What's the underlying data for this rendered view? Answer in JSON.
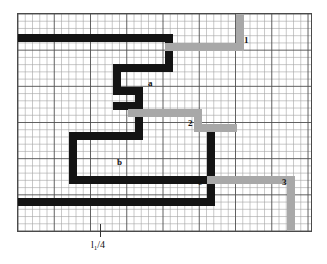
{
  "figure": {
    "title": "",
    "type": "grid-path-diagram",
    "colors": {
      "black_path": "#141414",
      "gray_path": "#a8a8a8",
      "grid_line": "#9a9a9a",
      "grid_major": "#555555",
      "border": "#4a4a4a",
      "background": "#ffffff"
    },
    "grid": {
      "x": 17,
      "y": 13,
      "width": 295,
      "height": 219,
      "cell": 7.3,
      "cols": 40,
      "rows": 30,
      "major_every": 5
    },
    "axis": {
      "bottom_label": "l",
      "bottom_label_sub": "1",
      "bottom_label_rest": "/4",
      "bottom_label_full": "l1/4",
      "tick_x": 100
    },
    "labels": [
      {
        "text": "1",
        "x": 244,
        "y": 36
      },
      {
        "text": "a",
        "x": 148,
        "y": 79
      },
      {
        "text": "2",
        "x": 188,
        "y": 119
      },
      {
        "text": "b",
        "x": 117,
        "y": 158
      },
      {
        "text": "c",
        "x": 198,
        "y": 178
      },
      {
        "text": "3",
        "x": 282,
        "y": 178
      }
    ],
    "segments": [
      {
        "name": "black-top-horizontal-bar",
        "color": "black",
        "x": 0,
        "y": 20,
        "w": 155,
        "h": 8
      },
      {
        "name": "black-stub-down-from-top-bar",
        "color": "black",
        "x": 147,
        "y": 20,
        "w": 8,
        "h": 30
      },
      {
        "name": "black-zig-a-horizontal",
        "color": "black",
        "x": 95,
        "y": 50,
        "w": 60,
        "h": 8
      },
      {
        "name": "black-zig-a-left-vertical",
        "color": "black",
        "x": 95,
        "y": 50,
        "w": 8,
        "h": 30
      },
      {
        "name": "black-zig-mid-horizontal",
        "color": "black",
        "x": 95,
        "y": 73,
        "w": 30,
        "h": 8
      },
      {
        "name": "black-zig-mid-vertical",
        "color": "black",
        "x": 117,
        "y": 73,
        "w": 8,
        "h": 22
      },
      {
        "name": "black-lower-connector-horizontal",
        "color": "black",
        "x": 95,
        "y": 88,
        "w": 30,
        "h": 8
      },
      {
        "name": "black-down-to-b-vertical",
        "color": "black",
        "x": 117,
        "y": 88,
        "w": 8,
        "h": 37
      },
      {
        "name": "black-b-top-horizontal",
        "color": "black",
        "x": 51,
        "y": 118,
        "w": 74,
        "h": 8
      },
      {
        "name": "black-b-left-vertical",
        "color": "black",
        "x": 51,
        "y": 118,
        "w": 8,
        "h": 52
      },
      {
        "name": "black-b-bottom-horizontal",
        "color": "black",
        "x": 51,
        "y": 162,
        "w": 167,
        "h": 8
      },
      {
        "name": "black-c-right-vertical",
        "color": "black",
        "x": 189,
        "y": 110,
        "w": 8,
        "h": 82
      },
      {
        "name": "black-c-top-horizontal",
        "color": "black",
        "x": 189,
        "y": 110,
        "w": 30,
        "h": 8
      },
      {
        "name": "black-bottom-long-horizontal",
        "color": "black",
        "x": 0,
        "y": 184,
        "w": 197,
        "h": 8
      },
      {
        "name": "gray-1-vertical",
        "color": "gray",
        "x": 218,
        "y": 0,
        "w": 8,
        "h": 37
      },
      {
        "name": "gray-1-horizontal",
        "color": "gray",
        "x": 147,
        "y": 29,
        "w": 79,
        "h": 8
      },
      {
        "name": "gray-2-left-vertical",
        "color": "gray",
        "x": 110,
        "y": 95,
        "w": 8,
        "h": 8
      },
      {
        "name": "gray-2-upper-horizontal",
        "color": "gray",
        "x": 110,
        "y": 95,
        "w": 74,
        "h": 8
      },
      {
        "name": "gray-2-mid-vertical",
        "color": "gray",
        "x": 176,
        "y": 95,
        "w": 8,
        "h": 22
      },
      {
        "name": "gray-2-lower-horizontal",
        "color": "gray",
        "x": 176,
        "y": 110,
        "w": 43,
        "h": 8
      },
      {
        "name": "gray-3-horizontal",
        "color": "gray",
        "x": 189,
        "y": 162,
        "w": 88,
        "h": 8
      },
      {
        "name": "gray-3-vertical",
        "color": "gray",
        "x": 269,
        "y": 162,
        "w": 8,
        "h": 57
      }
    ]
  }
}
